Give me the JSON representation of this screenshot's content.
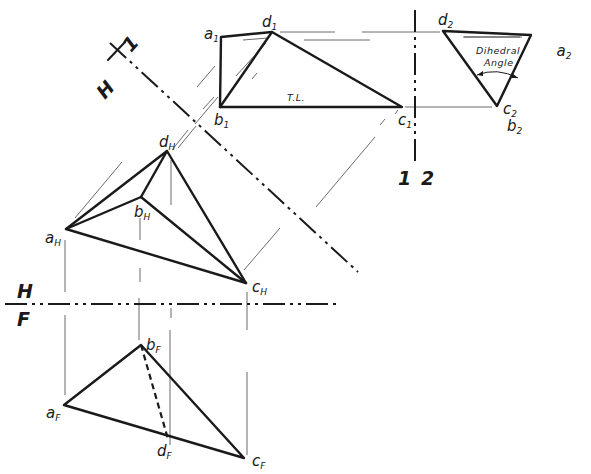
{
  "figure": {
    "type": "descriptive geometry - dihedral angle construction",
    "reference_lines": {
      "h_1": {
        "top": "1",
        "bottom": "H"
      },
      "h_f": {
        "top": "H",
        "bottom": "F"
      },
      "one_two": {
        "left": "1",
        "right": "2"
      }
    },
    "views": {
      "front": {
        "points": {
          "a": "a",
          "b": "b",
          "c": "c",
          "d": "d"
        },
        "subscript": "F"
      },
      "top": {
        "subscript": "H"
      },
      "aux1": {
        "subscript": "1",
        "annotation": "T.L."
      },
      "aux2": {
        "subscript": "2",
        "annotation_line1": "Dihedral",
        "annotation_line2": "Angle"
      }
    },
    "labels": {
      "aF": "a",
      "bF": "b",
      "cF": "c",
      "dF": "d",
      "F": "F",
      "aH": "a",
      "bH": "b",
      "cH": "c",
      "dH": "d",
      "H": "H",
      "a1": "a",
      "b1": "b",
      "c1": "c",
      "d1": "d",
      "one": "1",
      "a2": "a",
      "b2": "b",
      "c2": "c",
      "d2": "d",
      "two": "2"
    }
  }
}
